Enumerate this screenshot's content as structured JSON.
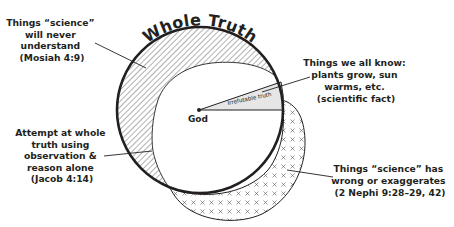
{
  "title": "Whole Truth",
  "center_label": "God",
  "wedge_label": "Irrefutable truth",
  "colors": {
    "ink": "#231f20",
    "wedge_fill": "#e6e6e6",
    "background": "#ffffff"
  },
  "labels": {
    "never_understand": {
      "lines": [
        "Things “science”",
        "will never",
        "understand",
        "(Mosiah 4:9)"
      ]
    },
    "all_know": {
      "lines": [
        "Things we all know:",
        "plants grow, sun",
        "warms, etc.",
        "(scientific fact)"
      ]
    },
    "attempt": {
      "lines": [
        "Attempt at whole",
        "truth using",
        "observation &",
        "reason alone",
        "(Jacob 4:14)"
      ]
    },
    "wrong": {
      "lines": [
        "Things “science” has",
        "wrong or exaggerates",
        "(2 Nephi 9:28–29, 42)"
      ]
    }
  },
  "regions": [
    {
      "name": "Whole Truth circle",
      "pattern": "none"
    },
    {
      "name": "Things science will never understand",
      "pattern": "diagonal-hatch"
    },
    {
      "name": "Attempt at whole truth using observation & reason alone",
      "pattern": "white"
    },
    {
      "name": "Irrefutable truth",
      "pattern": "solid-gray"
    },
    {
      "name": "Things science has wrong or exaggerates",
      "pattern": "crosses"
    }
  ]
}
